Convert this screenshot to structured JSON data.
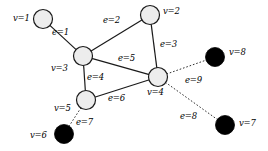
{
  "figure": {
    "type": "graph-diagram",
    "background_color": "#ffffff",
    "node_fill_open": "#ededed",
    "node_fill_solid": "#000000",
    "stroke_color": "#1a1a1a"
  },
  "nodes": [
    {
      "id": "v1",
      "label": "v=1",
      "cx": 43,
      "cy": 19,
      "r": 9.5,
      "style": "open",
      "label_x": 13,
      "label_y": 14
    },
    {
      "id": "v2",
      "label": "v=2",
      "cx": 150,
      "cy": 15,
      "r": 9.5,
      "style": "open",
      "label_x": 163,
      "label_y": 7
    },
    {
      "id": "v3",
      "label": "v=3",
      "cx": 83,
      "cy": 56,
      "r": 9.5,
      "style": "open",
      "label_x": 51,
      "label_y": 64
    },
    {
      "id": "v4",
      "label": "v=4",
      "cx": 158,
      "cy": 77,
      "r": 9.5,
      "style": "open",
      "label_x": 147,
      "label_y": 88
    },
    {
      "id": "v5",
      "label": "v=5",
      "cx": 86,
      "cy": 100,
      "r": 9.5,
      "style": "open",
      "label_x": 54,
      "label_y": 104
    },
    {
      "id": "v6",
      "label": "v=6",
      "cx": 64,
      "cy": 134,
      "r": 9.5,
      "style": "solid",
      "label_x": 30,
      "label_y": 131
    },
    {
      "id": "v7",
      "label": "v=7",
      "cx": 225,
      "cy": 125,
      "r": 9.5,
      "style": "solid",
      "label_x": 239,
      "label_y": 119
    },
    {
      "id": "v8",
      "label": "v=8",
      "cx": 215,
      "cy": 57,
      "r": 9.5,
      "style": "solid",
      "label_x": 229,
      "label_y": 48
    }
  ],
  "edges": [
    {
      "id": "e1",
      "label": "e=1",
      "from": "v1",
      "to": "v3",
      "style": "solid",
      "label_x": 52,
      "label_y": 28
    },
    {
      "id": "e2",
      "label": "e=2",
      "from": "v3",
      "to": "v2",
      "style": "solid",
      "label_x": 103,
      "label_y": 16
    },
    {
      "id": "e3",
      "label": "e=3",
      "from": "v2",
      "to": "v4",
      "style": "solid",
      "label_x": 160,
      "label_y": 40
    },
    {
      "id": "e4",
      "label": "e=4",
      "from": "v3",
      "to": "v5",
      "style": "solid",
      "label_x": 87,
      "label_y": 73
    },
    {
      "id": "e5",
      "label": "e=5",
      "from": "v3",
      "to": "v4",
      "style": "solid",
      "label_x": 118,
      "label_y": 54
    },
    {
      "id": "e6",
      "label": "e=6",
      "from": "v5",
      "to": "v4",
      "style": "solid",
      "label_x": 108,
      "label_y": 94
    },
    {
      "id": "e7",
      "label": "e=7",
      "from": "v5",
      "to": "v6",
      "style": "dotted",
      "label_x": 76,
      "label_y": 118
    },
    {
      "id": "e8",
      "label": "e=8",
      "from": "v4",
      "to": "v7",
      "style": "dotted",
      "label_x": 180,
      "label_y": 112
    },
    {
      "id": "e9",
      "label": "e=9",
      "from": "v4",
      "to": "v8",
      "style": "dotted",
      "label_x": 185,
      "label_y": 76
    }
  ]
}
